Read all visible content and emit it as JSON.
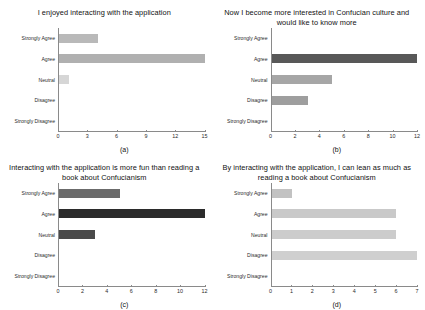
{
  "figure": {
    "background": "#ffffff",
    "categories": [
      "Strongly Agree",
      "Agree",
      "Neutral",
      "Disagree",
      "Strongly Disagree"
    ]
  },
  "chart_data": [
    {
      "type": "bar",
      "orientation": "horizontal",
      "panel": "a",
      "caption": "(a)",
      "title": "I enjoyed interacting with the application",
      "categories": [
        "Strongly Agree",
        "Agree",
        "Neutral",
        "Disagree",
        "Strongly Disagree"
      ],
      "values": [
        4,
        15,
        1,
        0,
        0
      ],
      "colors": [
        "#b9b9b9",
        "#b0b0b0",
        "#d6d6d6",
        "#b0b0b0",
        "#b0b0b0"
      ],
      "xlabel": "",
      "ylabel": "",
      "xlim": [
        0,
        15
      ],
      "xticks": [
        0,
        3,
        6,
        9,
        12,
        15
      ],
      "grid": false,
      "legend": "none"
    },
    {
      "type": "bar",
      "orientation": "horizontal",
      "panel": "b",
      "caption": "(b)",
      "title": "Now I become more interested in Confucian culture and would like to know more",
      "categories": [
        "Strongly Agree",
        "Agree",
        "Neutral",
        "Disagree",
        "Strongly Disagree"
      ],
      "values": [
        0,
        12,
        5,
        3,
        0
      ],
      "colors": [
        "#8f8f8f",
        "#585858",
        "#a6a6a6",
        "#9e9e9e",
        "#8f8f8f"
      ],
      "xlabel": "",
      "ylabel": "",
      "xlim": [
        0,
        12
      ],
      "xticks": [
        0,
        2,
        4,
        6,
        8,
        10,
        12
      ],
      "grid": false,
      "legend": "none"
    },
    {
      "type": "bar",
      "orientation": "horizontal",
      "panel": "c",
      "caption": "(c)",
      "title": "Interacting with the application is more fun than reading a book about Confucianism",
      "categories": [
        "Strongly Agree",
        "Agree",
        "Neutral",
        "Disagree",
        "Strongly Disagree"
      ],
      "values": [
        5,
        12,
        3,
        0,
        0
      ],
      "colors": [
        "#6b6b6b",
        "#2b2b2b",
        "#4a4a4a",
        "#6b6b6b",
        "#6b6b6b"
      ],
      "xlabel": "",
      "ylabel": "",
      "xlim": [
        0,
        12
      ],
      "xticks": [
        0,
        2,
        4,
        6,
        8,
        10,
        12
      ],
      "grid": false,
      "legend": "none"
    },
    {
      "type": "bar",
      "orientation": "horizontal",
      "panel": "d",
      "caption": "(d)",
      "title": "By interacting with the application, I can lean as much as reading a book about Confucianism",
      "categories": [
        "Strongly Agree",
        "Agree",
        "Neutral",
        "Disagree",
        "Strongly Disagree"
      ],
      "values": [
        1,
        6,
        6,
        7,
        0
      ],
      "colors": [
        "#c2c2c2",
        "#c9c9c9",
        "#cccccc",
        "#cfcfcf",
        "#c9c9c9"
      ],
      "xlabel": "",
      "ylabel": "",
      "xlim": [
        0,
        7
      ],
      "xticks": [
        0,
        1,
        2,
        3,
        4,
        5,
        6,
        7
      ],
      "grid": false,
      "legend": "none"
    }
  ]
}
